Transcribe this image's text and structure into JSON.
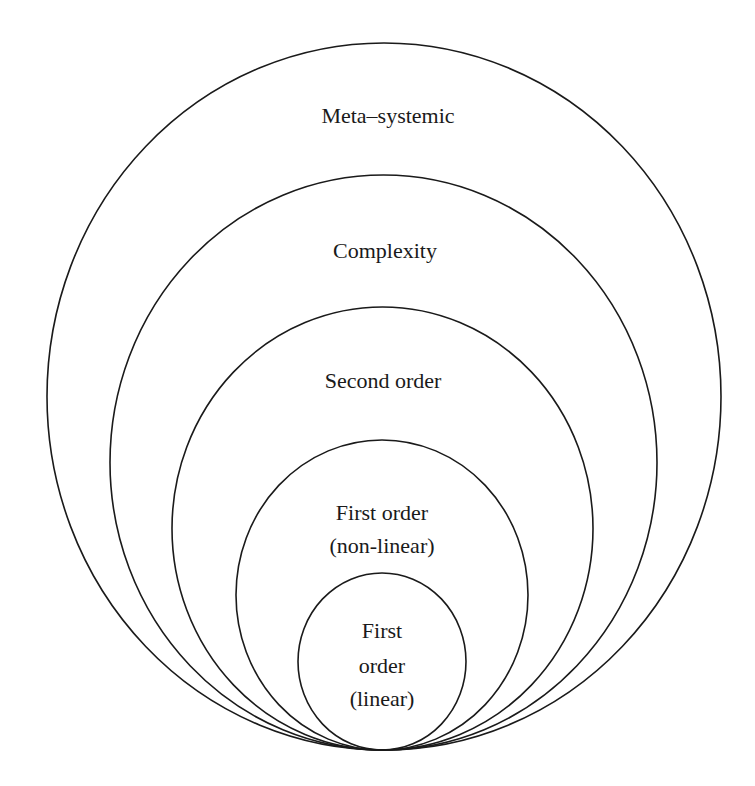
{
  "diagram": {
    "type": "nested-circles",
    "stroke_color": "#1a1a1a",
    "background": "#ffffff",
    "levels": [
      {
        "name": "meta-systemic",
        "lines": [
          "Meta–systemic"
        ],
        "ellipse": {
          "cx": 384,
          "cy": 396.5,
          "rx": 337,
          "ry": 353.5
        }
      },
      {
        "name": "complexity",
        "lines": [
          "Complexity"
        ],
        "ellipse": {
          "cx": 383.5,
          "cy": 462.5,
          "rx": 273.5,
          "ry": 287.5
        }
      },
      {
        "name": "second-order",
        "lines": [
          "Second order"
        ],
        "ellipse": {
          "cx": 382.5,
          "cy": 528.5,
          "rx": 210.5,
          "ry": 221.5
        }
      },
      {
        "name": "first-order-non-linear",
        "lines": [
          "First order",
          "(non-linear)"
        ],
        "ellipse": {
          "cx": 382,
          "cy": 595,
          "rx": 146,
          "ry": 155
        }
      },
      {
        "name": "first-order-linear",
        "lines": [
          "First",
          "order",
          "(linear)"
        ],
        "ellipse": {
          "cx": 382,
          "cy": 661.5,
          "rx": 84,
          "ry": 88.5
        }
      }
    ]
  }
}
